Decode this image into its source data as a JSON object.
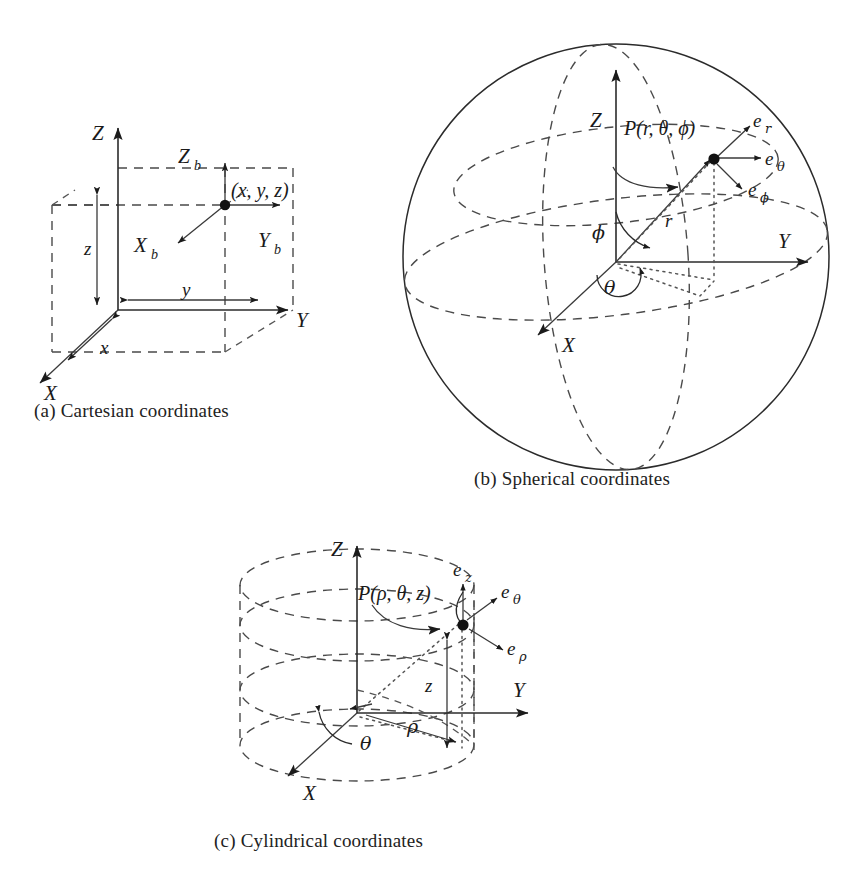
{
  "figure": {
    "background_color": "#ffffff",
    "ink_color": "#1a1a1a"
  },
  "panels": {
    "cartesian": {
      "caption": "(a) Cartesian coordinates",
      "axes": [
        {
          "name": "Z",
          "label": "Z"
        },
        {
          "name": "Y",
          "label": "Y"
        },
        {
          "name": "X",
          "label": "X"
        }
      ],
      "body_axes": [
        {
          "name": "Zb",
          "base": "Z",
          "sub": "b"
        },
        {
          "name": "Yb",
          "base": "Y",
          "sub": "b"
        },
        {
          "name": "Xb",
          "base": "X",
          "sub": "b"
        }
      ],
      "dimensions": [
        {
          "name": "z",
          "label": "z"
        },
        {
          "name": "y",
          "label": "y"
        },
        {
          "name": "x",
          "label": "x"
        }
      ],
      "point_label": "(x, y, z)"
    },
    "spherical": {
      "caption": "(b) Spherical coordinates",
      "axes": [
        {
          "name": "Z",
          "label": "Z"
        },
        {
          "name": "Y",
          "label": "Y"
        },
        {
          "name": "X",
          "label": "X"
        }
      ],
      "point_label": "P(r, θ, ϕ)",
      "radius_label": "r",
      "angles": [
        {
          "name": "phi",
          "label": "ϕ"
        },
        {
          "name": "theta",
          "label": "θ"
        }
      ],
      "unit_vectors": [
        {
          "name": "e_r",
          "base": "e",
          "sub": "r"
        },
        {
          "name": "e_theta",
          "base": "e",
          "sub": "θ"
        },
        {
          "name": "e_phi",
          "base": "e",
          "sub": "ϕ"
        }
      ]
    },
    "cylindrical": {
      "caption": "(c) Cylindrical coordinates",
      "axes": [
        {
          "name": "Z",
          "label": "Z"
        },
        {
          "name": "Y",
          "label": "Y"
        },
        {
          "name": "X",
          "label": "X"
        }
      ],
      "point_label": "P(ρ, θ, z)",
      "dimensions": [
        {
          "name": "rho",
          "label": "ρ"
        },
        {
          "name": "z",
          "label": "z"
        }
      ],
      "angles": [
        {
          "name": "theta",
          "label": "θ"
        }
      ],
      "unit_vectors": [
        {
          "name": "e_z",
          "base": "e",
          "sub": "z"
        },
        {
          "name": "e_theta",
          "base": "e",
          "sub": "θ"
        },
        {
          "name": "e_rho",
          "base": "e",
          "sub": "ρ"
        }
      ]
    }
  }
}
